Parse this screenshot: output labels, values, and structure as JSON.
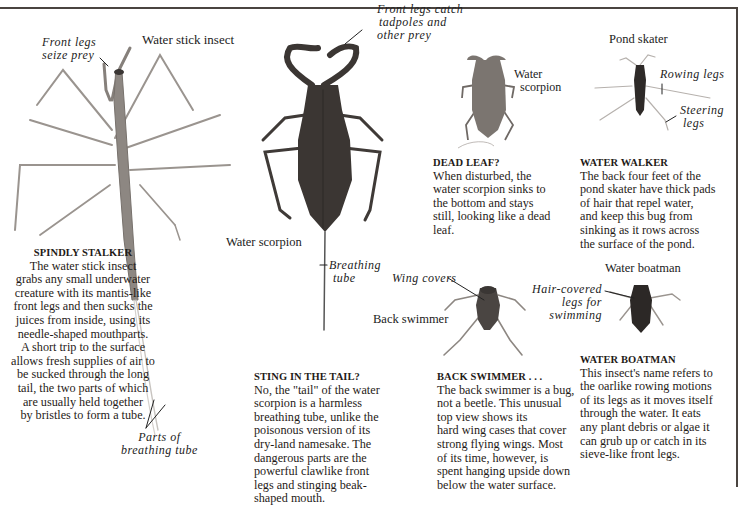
{
  "colors": {
    "rule": "#4a4440",
    "text": "#1f1b17",
    "stick_insect": "#8a8480",
    "water_scorpion_large": "#3b3633",
    "water_scorpion_small": "#7b7570",
    "pond_skater": "#2e2a28",
    "back_swimmer": "#4a4542",
    "water_boatman": "#2c2826"
  },
  "labels": {
    "water_stick_insect": "Water stick insect",
    "front_legs_seize_prey": [
      "Front legs",
      "seize prey"
    ],
    "parts_of_breathing_tube": [
      "Parts of",
      "breathing tube"
    ],
    "front_legs_catch": [
      "Front legs catch",
      "tadpoles and",
      "other prey"
    ],
    "water_scorpion_main": "Water scorpion",
    "breathing_tube": [
      "Breathing",
      "tube"
    ],
    "water_scorpion_small": [
      "Water",
      "scorpion"
    ],
    "pond_skater": "Pond skater",
    "rowing_legs": "Rowing legs",
    "steering_legs": [
      "Steering",
      "legs"
    ],
    "wing_covers": "Wing covers",
    "back_swimmer": "Back swimmer",
    "water_boatman": "Water boatman",
    "hair_covered_legs": [
      "Hair-covered",
      "legs for",
      "swimming"
    ]
  },
  "sections": {
    "spindly_stalker": {
      "heading": "SPINDLY STALKER",
      "lines": [
        "The water stick insect",
        "grabs any small underwater",
        "creature with its mantis-like",
        "front legs and then sucks the",
        "juices from inside, using its",
        "needle-shaped mouthparts.",
        "A short trip to the surface",
        "allows fresh supplies of air to",
        "be sucked through the long",
        "tail, the two parts of which",
        "are usually held together",
        "by bristles to form a tube."
      ]
    },
    "sting_in_the_tail": {
      "heading": "STING IN THE TAIL?",
      "lines": [
        "No, the \"tail\" of the water",
        "scorpion is a harmless",
        "breathing tube, unlike the",
        "poisonous version of its",
        "dry-land namesake. The",
        "dangerous parts are the",
        "powerful clawlike front",
        "legs and stinging beak-",
        "shaped mouth."
      ]
    },
    "dead_leaf": {
      "heading": "DEAD LEAF?",
      "lines": [
        "When disturbed, the",
        "water scorpion sinks to",
        "the bottom and stays",
        "still, looking like a dead",
        "leaf."
      ]
    },
    "water_walker": {
      "heading": "WATER WALKER",
      "lines": [
        "The back four feet of the",
        "pond skater have thick pads",
        "of hair that repel water,",
        "and keep this bug from",
        "sinking as it rows across",
        "the surface of the pond."
      ]
    },
    "back_swimmer": {
      "heading": "BACK SWIMMER . . .",
      "lines": [
        "The back swimmer is a bug,",
        "not a beetle. This unusual",
        "top view shows its",
        "hard wing cases that cover",
        "strong flying wings. Most",
        "of its time, however, is",
        "spent hanging upside down",
        "below the water surface."
      ]
    },
    "water_boatman": {
      "heading": "WATER BOATMAN",
      "lines": [
        "This insect's name refers to",
        "the oarlike rowing motions",
        "of its legs as it moves itself",
        "through the water. It eats",
        "any plant debris or algae it",
        "can grub up or catch in its",
        "sieve-like front legs."
      ]
    }
  }
}
